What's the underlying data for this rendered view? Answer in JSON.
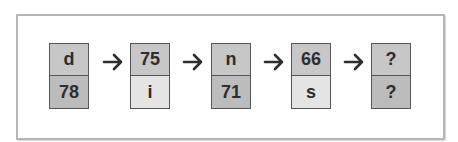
{
  "puzzle": {
    "boxes": [
      {
        "top": "d",
        "bottom": "78",
        "top_shade": "dark",
        "bottom_shade": "darker"
      },
      {
        "top": "75",
        "bottom": "i",
        "top_shade": "dark",
        "bottom_shade": "light"
      },
      {
        "top": "n",
        "bottom": "71",
        "top_shade": "dark",
        "bottom_shade": "darker"
      },
      {
        "top": "66",
        "bottom": "s",
        "top_shade": "dark",
        "bottom_shade": "light"
      },
      {
        "top": "?",
        "bottom": "?",
        "top_shade": "dark",
        "bottom_shade": "darker"
      }
    ],
    "arrow_icon": "right-arrow-icon",
    "colors": {
      "dark": "#c7c7c7",
      "darker": "#bcbcbc",
      "light": "#e4e4e4",
      "border": "#555555",
      "text": "#2e2e2e"
    }
  }
}
